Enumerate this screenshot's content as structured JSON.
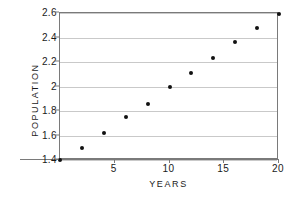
{
  "chart_data": {
    "type": "scatter",
    "title": "",
    "xlabel": "YEARS",
    "ylabel": "POPULATION",
    "xlim": [
      0,
      20
    ],
    "ylim": [
      1.4,
      2.6
    ],
    "xticks": [
      5,
      10,
      15,
      20
    ],
    "xtick_labels": [
      "5",
      "10",
      "15",
      "20"
    ],
    "yticks": [
      1.4,
      1.6,
      1.8,
      2.0,
      2.2,
      2.4,
      2.6
    ],
    "ytick_labels": [
      "1.4",
      "1.6",
      "1.8",
      "2",
      "2.2",
      "2.4",
      "2.6"
    ],
    "grid": "horizontal",
    "legend": "none",
    "x": [
      0,
      2,
      4,
      6,
      8,
      10,
      12,
      14,
      16,
      18,
      20
    ],
    "y": [
      1.4,
      1.5,
      1.62,
      1.75,
      1.86,
      2.0,
      2.11,
      2.23,
      2.36,
      2.48,
      2.59
    ],
    "series": [
      {
        "name": "Population",
        "marker": "filled-circle",
        "color": "#111111",
        "points": [
          {
            "x": 0,
            "y": 1.4
          },
          {
            "x": 2,
            "y": 1.5
          },
          {
            "x": 4,
            "y": 1.62
          },
          {
            "x": 6,
            "y": 1.75
          },
          {
            "x": 8,
            "y": 1.86
          },
          {
            "x": 10,
            "y": 2.0
          },
          {
            "x": 12,
            "y": 2.11
          },
          {
            "x": 14,
            "y": 2.23
          },
          {
            "x": 16,
            "y": 2.36
          },
          {
            "x": 18,
            "y": 2.48
          },
          {
            "x": 20,
            "y": 2.59
          }
        ]
      }
    ],
    "colors": {
      "marker": "#111111",
      "gridline": "#c9c9c9",
      "frame": "#7a7a7a",
      "text": "#1a1a1a",
      "background": "#ffffff"
    }
  }
}
